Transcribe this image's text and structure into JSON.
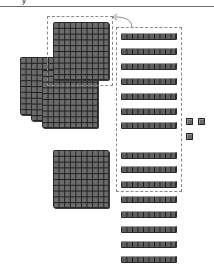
{
  "header": {
    "cropped_glyph": "y"
  },
  "diagram": {
    "colors": {
      "block_fill": "#6b6b6b",
      "grid_line": "#1e1e1e",
      "dashed_border": "#8a8a8a",
      "rule": "#6f6f6f"
    },
    "hundreds_flats_top_group": 4,
    "hundreds_flat_bottom": 1,
    "tens_rods_total": 15,
    "tens_rods_in_exchange_box": 10,
    "ones_cubes": 3,
    "arrow": "curved-arrow from hundred flat box to tens rods box"
  }
}
